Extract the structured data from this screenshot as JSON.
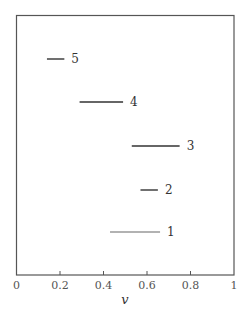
{
  "chart_data": {
    "type": "interval",
    "title": "",
    "xlabel": "v",
    "ylabel": "",
    "xlim": [
      0,
      1
    ],
    "xticks": [
      0,
      0.2,
      0.4,
      0.6,
      0.8,
      1
    ],
    "xtick_labels": [
      "0",
      "0.2",
      "0.4",
      "0.6",
      "0.8",
      "1"
    ],
    "grid": false,
    "legend": null,
    "series": [
      {
        "name": "5",
        "x_start": 0.14,
        "x_end": 0.22,
        "color": "#333333"
      },
      {
        "name": "4",
        "x_start": 0.29,
        "x_end": 0.49,
        "color": "#333333"
      },
      {
        "name": "3",
        "x_start": 0.53,
        "x_end": 0.75,
        "color": "#333333"
      },
      {
        "name": "2",
        "x_start": 0.57,
        "x_end": 0.65,
        "color": "#333333"
      },
      {
        "name": "1",
        "x_start": 0.43,
        "x_end": 0.66,
        "color": "#999999"
      }
    ]
  }
}
